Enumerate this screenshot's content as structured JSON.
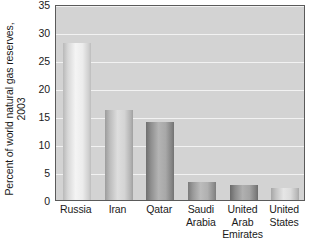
{
  "chart_data": {
    "type": "bar",
    "title": "",
    "xlabel": "",
    "ylabel": "Percent of world natural gas reserves, 2003",
    "ylabel_lines": [
      "Percent of world natural gas reserves,",
      "2003"
    ],
    "categories": [
      "Russia",
      "Iran",
      "Qatar",
      "Saudi Arabia",
      "United Arab Emirates",
      "United States"
    ],
    "category_lines": [
      [
        "Russia"
      ],
      [
        "Iran"
      ],
      [
        "Qatar"
      ],
      [
        "Saudi",
        "Arabia"
      ],
      [
        "United",
        "Arab",
        "Emirates"
      ],
      [
        "United",
        "States"
      ]
    ],
    "values": [
      28,
      16,
      14,
      3.2,
      2.7,
      2.1
    ],
    "ylim": [
      0,
      35
    ],
    "ytick_labels": [
      "0",
      "5",
      "10",
      "15",
      "20",
      "25",
      "30",
      "35"
    ],
    "ytick_values": [
      0,
      5,
      10,
      15,
      20,
      25,
      30,
      35
    ],
    "grid": true,
    "grid_axis": "y",
    "legend": "none"
  },
  "style": {
    "plot_background": "#d3d3d3",
    "gridline_color": "#f2f2f2",
    "axis_border_color": "#5a5a5a",
    "text_color": "#1a1a1a",
    "page_background": "#ffffff",
    "bar_fills": [
      "linear-gradient(to right, #b9b9b9 0%, #d8d8d8 18%, #f4f4f4 45%, #ececec 70%, #cfcfcf 92%, #bdbdbd 100%)",
      "linear-gradient(to right, #9c9c9c 0%, #bdbdbd 18%, #dedede 45%, #d4d4d4 70%, #b2b2b2 92%, #a0a0a0 100%)",
      "linear-gradient(to right, #6f6f6f 0%, #8f8f8f 18%, #b4b4b4 45%, #a8a8a8 70%, #838383 92%, #727272 100%)",
      "linear-gradient(to right, #7a7a7a 0%, #9a9a9a 18%, #bcbcbc 45%, #b0b0b0 70%, #8d8d8d 92%, #7d7d7d 100%)",
      "linear-gradient(to right, #6a6a6a 0%, #8b8b8b 18%, #b0b0b0 45%, #a4a4a4 70%, #7f7f7f 92%, #6d6d6d 100%)",
      "linear-gradient(to right, #a6a6a6 0%, #c4c4c4 18%, #e6e6e6 45%, #dcdcdc 70%, #bababa 92%, #a9a9a9 100%)"
    ]
  }
}
